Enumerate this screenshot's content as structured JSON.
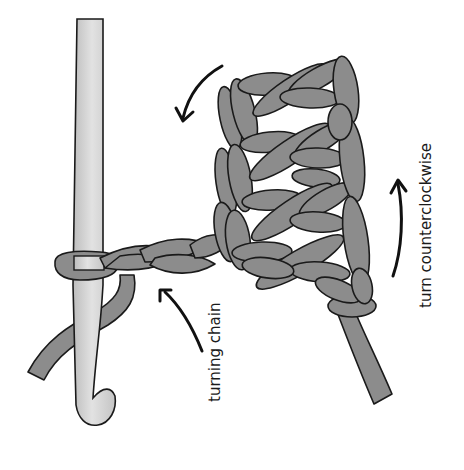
{
  "diagram": {
    "labels": {
      "turning_chain": "turning chain",
      "turn_direction": "turn counterclockwise"
    },
    "arrows": [
      {
        "name": "turn-arrow-top",
        "meaning": "rotation direction"
      },
      {
        "name": "turn-arrow-right",
        "meaning": "turn counterclockwise"
      },
      {
        "name": "turning-chain-pointer",
        "meaning": "points to turning chain"
      }
    ],
    "components": [
      "crochet-hook",
      "turning-chain",
      "stitch-fabric",
      "yarn-tail",
      "working-yarn"
    ],
    "colors": {
      "yarn": "#8c8c8c",
      "hook": "#d4d4d4",
      "outline": "#1a1a1a",
      "background": "#ffffff"
    }
  }
}
